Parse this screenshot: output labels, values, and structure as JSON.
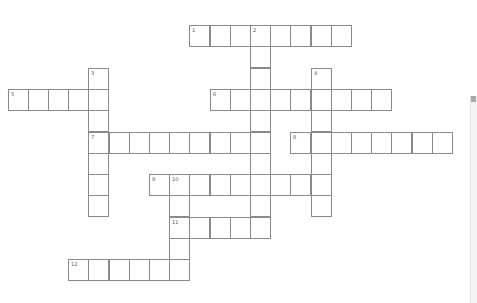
{
  "puzzle": {
    "type": "crossword",
    "grid_origin": {
      "x": 7.5,
      "y": 25
    },
    "cell_size": {
      "w": 20.2,
      "h": 21.3
    },
    "entries": [
      {
        "number": "1",
        "direction": "across",
        "row": 0,
        "col": 9,
        "length": 8
      },
      {
        "number": "2",
        "direction": "down",
        "row": 0,
        "col": 12,
        "length": 10
      },
      {
        "number": "3",
        "direction": "down",
        "row": 2,
        "col": 4,
        "length": 7
      },
      {
        "number": "4",
        "direction": "down",
        "row": 2,
        "col": 15,
        "length": 7
      },
      {
        "number": "5",
        "direction": "across",
        "row": 3,
        "col": 0,
        "length": 5
      },
      {
        "number": "6",
        "direction": "across",
        "row": 3,
        "col": 10,
        "length": 9
      },
      {
        "number": "7",
        "direction": "across",
        "row": 5,
        "col": 4,
        "length": 9
      },
      {
        "number": "8",
        "direction": "across",
        "row": 5,
        "col": 14,
        "length": 8
      },
      {
        "number": "9",
        "direction": "across",
        "row": 7,
        "col": 7,
        "length": 9
      },
      {
        "number": "10",
        "direction": "down",
        "row": 7,
        "col": 8,
        "length": 5
      },
      {
        "number": "11",
        "direction": "across",
        "row": 9,
        "col": 8,
        "length": 5
      },
      {
        "number": "12",
        "direction": "across",
        "row": 11,
        "col": 3,
        "length": 6
      }
    ]
  },
  "colors": {
    "border": "#8a8a8a",
    "number": "#555555",
    "background": "#ffffff"
  }
}
